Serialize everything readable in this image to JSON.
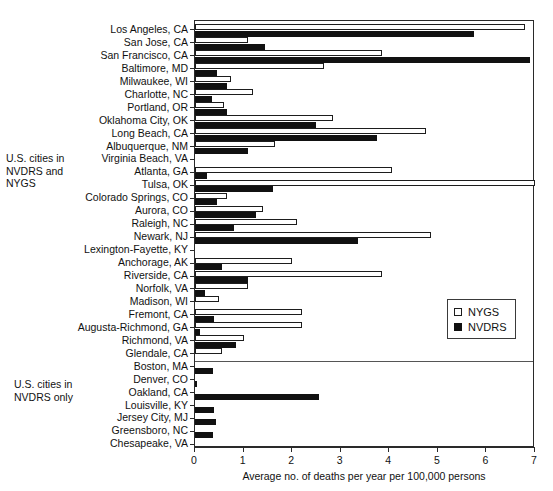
{
  "chart_data": {
    "type": "bar",
    "orientation": "horizontal",
    "title": "",
    "xlabel": "Average no. of deaths per year per 100,000 persons",
    "ylabel": "",
    "xlim": [
      0,
      7
    ],
    "xticks": [
      0,
      1,
      2,
      3,
      4,
      5,
      6,
      7
    ],
    "grid": false,
    "legend_position": "middle-right",
    "legend": [
      "NYGS",
      "NVDRS"
    ],
    "series": [
      {
        "name": "NYGS",
        "color": "#ffffff",
        "style": "open-outline"
      },
      {
        "name": "NVDRS",
        "color": "#111111",
        "style": "solid-fill"
      }
    ],
    "groups": [
      {
        "caption": "U.S. cities in\nNVDRS and\nNYGS",
        "categories": [
          "Los Angeles, CA",
          "San Jose, CA",
          "San Francisco, CA",
          "Baltimore, MD",
          "Milwaukee, WI",
          "Charlotte, NC",
          "Portland, OR",
          "Oklahoma City, OK",
          "Long Beach, CA",
          "Albuquerque, NM",
          "Virginia Beach, VA",
          "Atlanta, GA",
          "Tulsa, OK",
          "Colorado Springs, CO",
          "Aurora, CO",
          "Raleigh, NC",
          "Newark, NJ",
          "Lexington-Fayette, KY",
          "Anchorage, AK",
          "Riverside, CA",
          "Norfolk, VA",
          "Madison, WI",
          "Fremont, CA",
          "Augusta-Richmond, GA",
          "Richmond, VA",
          "Glendale, CA"
        ],
        "NYGS": [
          6.8,
          1.1,
          3.85,
          2.65,
          0.75,
          1.2,
          0.6,
          2.85,
          4.75,
          1.65,
          0.0,
          4.05,
          7.0,
          0.65,
          1.4,
          2.1,
          4.85,
          0.0,
          2.0,
          3.85,
          1.1,
          0.5,
          2.2,
          2.2,
          1.0,
          0.55
        ],
        "NVDRS": [
          5.75,
          1.45,
          6.9,
          0.45,
          0.65,
          0.35,
          0.65,
          2.5,
          3.75,
          1.1,
          0.0,
          0.25,
          1.6,
          0.45,
          1.25,
          0.8,
          3.35,
          0.0,
          0.55,
          1.1,
          0.2,
          0.0,
          0.4,
          0.1,
          0.85,
          0.0
        ]
      },
      {
        "caption": "U.S. cities in\nNVDRS only",
        "categories": [
          "Boston, MA",
          "Denver, CO",
          "Oakland, CA",
          "Louisville, KY",
          "Jersey City, MJ",
          "Greensboro, NC",
          "Chesapeake, VA"
        ],
        "NYGS": [
          0.0,
          0.0,
          0.0,
          0.0,
          0.0,
          0.0,
          0.0
        ],
        "NVDRS": [
          0.37,
          0.04,
          2.55,
          0.4,
          0.44,
          0.37,
          0.0
        ]
      }
    ]
  },
  "legend": {
    "items": [
      {
        "label": "NYGS",
        "swatch": "open-square-icon"
      },
      {
        "label": "NVDRS",
        "swatch": "filled-square-icon"
      }
    ]
  },
  "axis": {
    "x_label": "Average no. of deaths per year per 100,000 persons",
    "tick_labels": [
      "0",
      "1",
      "2",
      "3",
      "4",
      "5",
      "6",
      "7"
    ]
  },
  "captions": {
    "group_both": "U.S. cities in\nNVDRS and\nNYGS",
    "group_only": "U.S. cities in\nNVDRS only"
  },
  "title_strip": ""
}
